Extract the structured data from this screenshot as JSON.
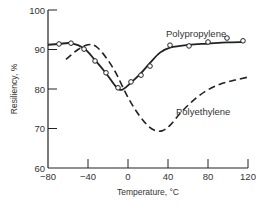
{
  "chart_data": {
    "type": "line",
    "title": "",
    "xlabel": "Temperature, °C",
    "ylabel": "Resiliency, %",
    "xlim": [
      -80,
      120
    ],
    "ylim": [
      60,
      100
    ],
    "x_ticks": [
      -80,
      -40,
      0,
      40,
      80,
      120
    ],
    "x_tick_labels": [
      "−80",
      "−40",
      "0",
      "40",
      "80",
      "120"
    ],
    "y_ticks": [
      60,
      70,
      80,
      90,
      100
    ],
    "y_tick_labels": [
      "60",
      "70",
      "80",
      "90",
      "100"
    ],
    "grid": false,
    "legend": "inline labels",
    "series": [
      {
        "name": "Polypropylene",
        "style": "solid line with open circle markers",
        "color": "#222222",
        "points": [
          [
            -69,
            91.4
          ],
          [
            -57,
            91.6
          ],
          [
            -44,
            90.1
          ],
          [
            -33,
            87.1
          ],
          [
            -22,
            84.1
          ],
          [
            -10,
            80.3
          ],
          [
            3,
            81.8
          ],
          [
            13,
            83.5
          ],
          [
            22,
            85.8
          ],
          [
            42,
            91.1
          ],
          [
            61,
            90.9
          ],
          [
            80,
            91.9
          ],
          [
            99,
            92.9
          ],
          [
            115,
            92.2
          ]
        ],
        "curve": [
          [
            -80,
            91.2
          ],
          [
            -69,
            91.4
          ],
          [
            -57,
            91.6
          ],
          [
            -44,
            90.3
          ],
          [
            -33,
            87.3
          ],
          [
            -22,
            84.0
          ],
          [
            -12,
            80.6
          ],
          [
            -6,
            79.8
          ],
          [
            3,
            81.6
          ],
          [
            13,
            84.0
          ],
          [
            22,
            86.6
          ],
          [
            32,
            89.2
          ],
          [
            42,
            90.5
          ],
          [
            61,
            91.2
          ],
          [
            80,
            91.5
          ],
          [
            99,
            91.8
          ],
          [
            115,
            91.9
          ]
        ],
        "label_position": [
          38,
          93.2
        ]
      },
      {
        "name": "Polyethylene",
        "style": "dashed line",
        "color": "#222222",
        "curve": [
          [
            -62,
            87.5
          ],
          [
            -50,
            90.0
          ],
          [
            -40,
            91.2
          ],
          [
            -32,
            90.8
          ],
          [
            -22,
            88.0
          ],
          [
            -12,
            84.0
          ],
          [
            -2,
            78.8
          ],
          [
            8,
            74.5
          ],
          [
            18,
            71.2
          ],
          [
            26,
            69.6
          ],
          [
            34,
            69.4
          ],
          [
            42,
            70.8
          ],
          [
            52,
            73.8
          ],
          [
            64,
            76.8
          ],
          [
            78,
            79.5
          ],
          [
            92,
            81.2
          ],
          [
            106,
            82.2
          ],
          [
            120,
            83.0
          ]
        ],
        "label_position": [
          48,
          73.5
        ]
      }
    ]
  }
}
